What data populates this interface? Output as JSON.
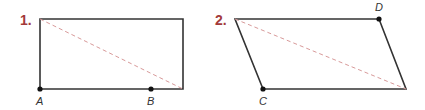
{
  "colors": {
    "number": "#a33a3a",
    "outline": "#333333",
    "diagonal": "#d89a9a",
    "label": "#333333"
  },
  "figures": [
    {
      "number": "1.",
      "shape": "rectangle",
      "vertices": [
        [
          40,
          19
        ],
        [
          183,
          19
        ],
        [
          183,
          89
        ],
        [
          40,
          89
        ]
      ],
      "diagonal": [
        [
          40,
          19
        ],
        [
          183,
          89
        ]
      ],
      "points": [
        {
          "label": "A",
          "x": 40,
          "y": 89
        },
        {
          "label": "B",
          "x": 151,
          "y": 89
        }
      ]
    },
    {
      "number": "2.",
      "shape": "parallelogram",
      "vertices": [
        [
          235,
          19
        ],
        [
          379,
          19
        ],
        [
          406,
          89
        ],
        [
          263,
          89
        ]
      ],
      "diagonal": [
        [
          235,
          19
        ],
        [
          406,
          89
        ]
      ],
      "points": [
        {
          "label": "D",
          "x": 379,
          "y": 19
        },
        {
          "label": "C",
          "x": 263,
          "y": 89
        }
      ]
    }
  ]
}
